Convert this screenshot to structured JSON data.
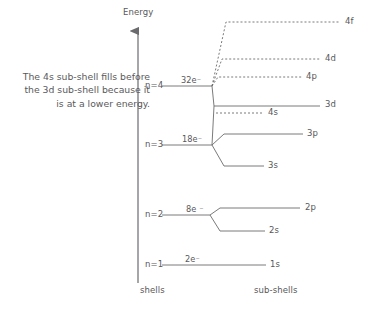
{
  "diagram": {
    "title_axis": "Energy",
    "caption": "The 4s sub-shell fills before the 3d sub-shell because it is at a lower energy.",
    "column_headers": {
      "left": "shells",
      "right": "sub-shells"
    },
    "colors": {
      "line": "#6b6b6d",
      "text": "#58585a",
      "background": "#ffffff"
    },
    "shells": [
      {
        "name": "n=1",
        "electrons": "2e⁻",
        "y": 265
      },
      {
        "name": "n=2",
        "electrons": "8e ⁻",
        "y": 215
      },
      {
        "name": "n=3",
        "electrons": "18e⁻",
        "y": 145
      },
      {
        "name": "n=4",
        "electrons": "32e⁻",
        "y": 86
      }
    ],
    "subshells": [
      {
        "label": "1s",
        "style": "solid",
        "y": 265,
        "shell": "n=1"
      },
      {
        "label": "2s",
        "style": "solid",
        "y": 231,
        "shell": "n=2"
      },
      {
        "label": "2p",
        "style": "solid",
        "y": 208,
        "shell": "n=2"
      },
      {
        "label": "3s",
        "style": "solid",
        "y": 166,
        "shell": "n=3"
      },
      {
        "label": "3p",
        "style": "solid",
        "y": 134,
        "shell": "n=3"
      },
      {
        "label": "4s",
        "style": "dotted",
        "y": 113,
        "shell": "n=4"
      },
      {
        "label": "3d",
        "style": "solid",
        "y": 105,
        "shell": "n=3"
      },
      {
        "label": "4p",
        "style": "dotted",
        "y": 77,
        "shell": "n=4"
      },
      {
        "label": "4d",
        "style": "dotted",
        "y": 59,
        "shell": "n=4"
      },
      {
        "label": "4f",
        "style": "dotted",
        "y": 22,
        "shell": "n=4"
      }
    ]
  }
}
